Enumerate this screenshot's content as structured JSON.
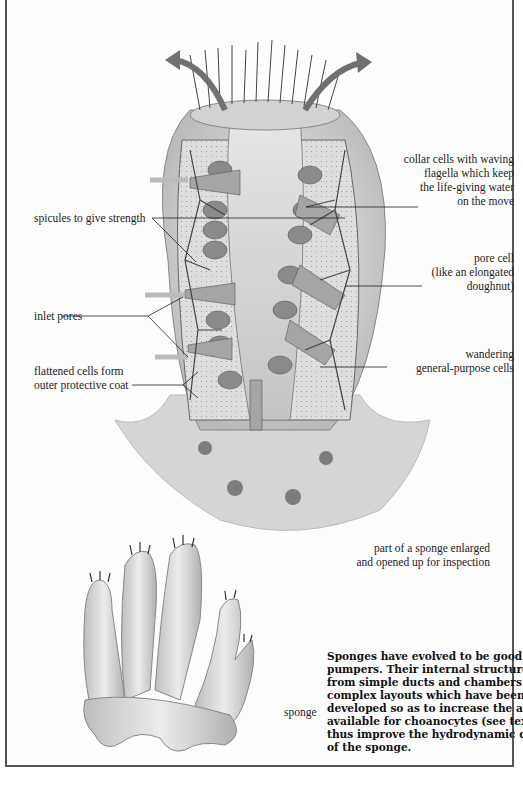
{
  "figure": {
    "title": "part of a sponge enlarged and opened up for inspection",
    "labels": {
      "collar_cells": [
        "collar cells with waving",
        "flagella which keep",
        "the life-giving water",
        "on the move"
      ],
      "spicules": [
        "spicules to give strength"
      ],
      "pore_cell": [
        "pore cell",
        "(like an elongated",
        "doughnut)"
      ],
      "inlet_pores": [
        "inlet pores"
      ],
      "wandering_cells": [
        "wandering",
        "general-purpose cells"
      ],
      "flattened_cells": [
        "flattened cells form",
        "outer protective coat"
      ],
      "enlarged_caption": [
        "part of a sponge enlarged",
        "and opened up for inspection"
      ],
      "sponge": [
        "sponge"
      ]
    },
    "caption_lines": [
      "Sponges have evolved to be good",
      "pumpers. Their internal structures range",
      "from simple ducts and chambers to",
      "complex layouts which have been",
      "developed so as to increase the area",
      "available for choanocytes (see text) and",
      "thus improve the hydrodynamic qualities",
      "of the sponge."
    ],
    "colors": {
      "ink": "#222222",
      "border": "#555555",
      "tissue": "#d8d8d8",
      "arrow": "#707070"
    }
  }
}
